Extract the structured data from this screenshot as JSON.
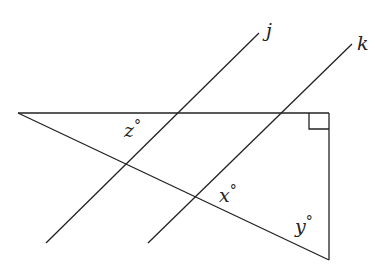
{
  "diagram": {
    "type": "geometry",
    "stroke_color": "#222222",
    "background": "#ffffff",
    "lines": {
      "top_side": {
        "x1": 18,
        "y1": 113,
        "x2": 329,
        "y2": 113
      },
      "right_side": {
        "x1": 329,
        "y1": 113,
        "x2": 329,
        "y2": 260
      },
      "hypotenuse": {
        "x1": 18,
        "y1": 113,
        "x2": 329,
        "y2": 260
      },
      "line_j": {
        "x1": 46,
        "y1": 243,
        "x2": 259,
        "y2": 33
      },
      "line_k": {
        "x1": 148,
        "y1": 243,
        "x2": 352,
        "y2": 44
      }
    },
    "right_angle_marker": {
      "x": 309,
      "y": 113,
      "size": 20,
      "height": 16
    },
    "labels": {
      "j": {
        "text": "j",
        "x": 266,
        "y": 37
      },
      "k": {
        "text": "k",
        "x": 357,
        "y": 50
      },
      "z": {
        "text": "z",
        "x": 124,
        "y": 137,
        "degree": "°"
      },
      "x": {
        "text": "x",
        "x": 219,
        "y": 202,
        "degree": "°"
      },
      "y": {
        "text": "y",
        "x": 295,
        "y": 233,
        "degree": "°"
      }
    }
  }
}
